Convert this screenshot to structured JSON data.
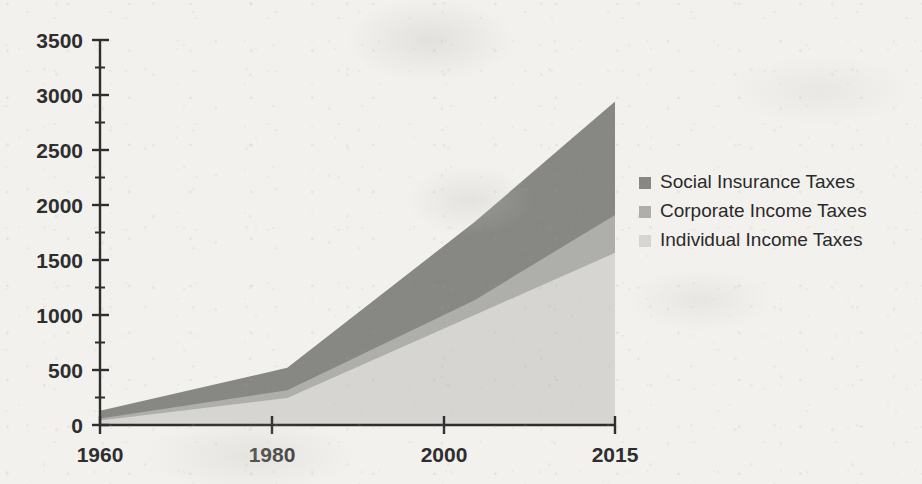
{
  "chart_data": {
    "type": "area",
    "stacked": true,
    "title": "",
    "subtitle": "",
    "xlabel": "",
    "ylabel": "",
    "x": [
      1960,
      1980,
      2000,
      2015
    ],
    "xtick_labels": [
      "1960",
      "1980",
      "2000",
      "2015"
    ],
    "xlim": [
      1960,
      2015
    ],
    "ytick_labels": [
      "0",
      "500",
      "1000",
      "1500",
      "2000",
      "2500",
      "3000",
      "3500"
    ],
    "ytick_values": [
      0,
      500,
      1000,
      1500,
      2000,
      2500,
      3000,
      3500
    ],
    "ylim": [
      0,
      3500
    ],
    "y_minor_tick_step": 250,
    "grid": false,
    "legend_position": "right",
    "series": [
      {
        "name": "Individual Income Taxes",
        "color": "#d6d5d2",
        "values": [
          40,
          245,
          1000,
          1565
        ],
        "stack_order": 1
      },
      {
        "name": "Corporate Income Taxes",
        "color": "#aeaeab",
        "values": [
          20,
          70,
          135,
          345
        ],
        "stack_order": 2
      },
      {
        "name": "Social Insurance Taxes",
        "color": "#878784",
        "values": [
          70,
          205,
          710,
          1030
        ],
        "stack_order": 3
      }
    ],
    "cumulative_totals": [
      130,
      520,
      1845,
      2940
    ]
  },
  "legend": {
    "items": [
      {
        "label": "Social Insurance Taxes",
        "color": "#878784"
      },
      {
        "label": "Corporate Income Taxes",
        "color": "#aeaeab"
      },
      {
        "label": "Individual Income Taxes",
        "color": "#d6d5d2"
      }
    ]
  },
  "axes": {
    "y_ticks": [
      {
        "label": "3500",
        "value": 3500
      },
      {
        "label": "3000",
        "value": 3000
      },
      {
        "label": "2500",
        "value": 2500
      },
      {
        "label": "2000",
        "value": 2000
      },
      {
        "label": "1500",
        "value": 1500
      },
      {
        "label": "1000",
        "value": 1000
      },
      {
        "label": "500",
        "value": 500
      },
      {
        "label": "0",
        "value": 0
      }
    ],
    "x_ticks": [
      {
        "label": "1960",
        "value": 1960
      },
      {
        "label": "1980",
        "value": 1980
      },
      {
        "label": "2000",
        "value": 2000
      },
      {
        "label": "2015",
        "value": 2015
      }
    ],
    "axis_color": "#2e2e2e"
  },
  "colors": {
    "background": "#f2f1ee",
    "axis": "#2e2e2e",
    "series_dark": "#878784",
    "series_medium": "#aeaeab",
    "series_light": "#d6d5d2"
  }
}
